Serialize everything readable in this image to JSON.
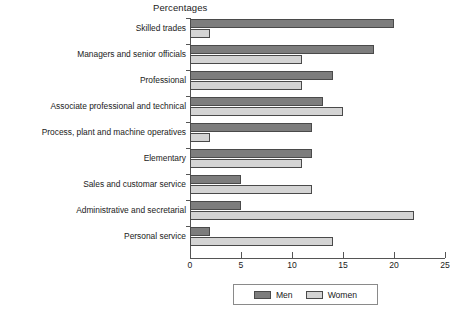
{
  "chart_data": {
    "type": "bar",
    "orientation": "horizontal",
    "title": "Percentages",
    "xlabel": "",
    "ylabel": "",
    "xlim": [
      0,
      25
    ],
    "xticks": [
      0,
      5,
      10,
      15,
      20,
      25
    ],
    "xtick_labels": [
      "0",
      "5",
      "10",
      "15",
      "20",
      "25"
    ],
    "grid": false,
    "legend_position": "bottom-center",
    "categories": [
      "Skilled trades",
      "Managers and senior officials",
      "Professional",
      "Associate professional and technical",
      "Process, plant and machine operatives",
      "Elementary",
      "Sales and customar service",
      "Administrative and secretarial",
      "Personal service"
    ],
    "series": [
      {
        "name": "Men",
        "color": "#7d7d7d",
        "values": [
          20,
          18,
          14,
          13,
          12,
          12,
          5,
          5,
          2
        ]
      },
      {
        "name": "Women",
        "color": "#d4d4d4",
        "values": [
          2,
          11,
          11,
          15,
          2,
          11,
          12,
          22,
          14
        ]
      }
    ]
  }
}
